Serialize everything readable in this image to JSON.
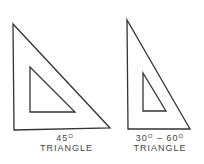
{
  "figures": [
    {
      "name": "45-triangle",
      "angle_label": "45",
      "degree_symbol": "O",
      "type_label": "TRIANGLE"
    },
    {
      "name": "30-60-triangle",
      "angle_label_a": "30",
      "angle_label_b": "60",
      "separator": "–",
      "degree_symbol": "O",
      "type_label": "TRIANGLE"
    }
  ],
  "colors": {
    "stroke": "#333333",
    "background": "#ffffff"
  }
}
